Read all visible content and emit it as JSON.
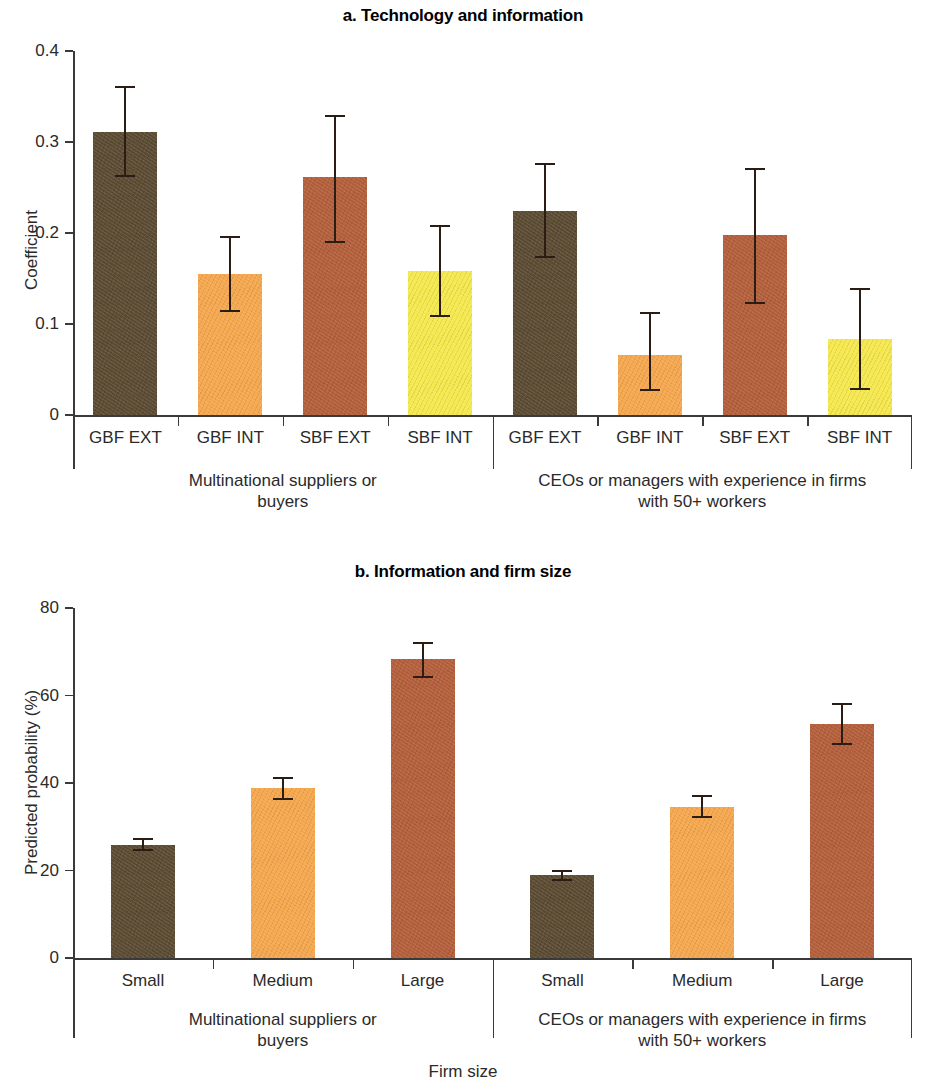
{
  "figure": {
    "panels": [
      {
        "id": "a",
        "title": "a. Technology and information",
        "ylabel": "Coefficient",
        "yticks": [
          "0",
          "0.1",
          "0.2",
          "0.3",
          "0.4"
        ]
      },
      {
        "id": "b",
        "title": "b. Information and firm size",
        "ylabel": "Predicted probability (%)",
        "yticks": [
          "0",
          "20",
          "40",
          "60",
          "80"
        ],
        "xlabel": "Firm size"
      }
    ],
    "groups": [
      "Multinational suppliers or buyers",
      "CEOs or managers with experience in firms with 50+ workers"
    ],
    "group_lines": {
      "g1_line1": "Multinational suppliers or",
      "g1_line2": "buyers",
      "g2_line1": "CEOs or managers with experience in firms",
      "g2_line2": "with 50+ workers"
    },
    "colors": {
      "dark_brown": "#5c4c33",
      "orange": "#f6a84f",
      "sienna": "#b5603c",
      "yellow": "#f6e84f",
      "axis": "#3a3a3a",
      "error": "#2b1d14",
      "text": "#2a2a2a"
    }
  },
  "chart_data": [
    {
      "type": "bar",
      "panel": "a",
      "title": "a. Technology and information",
      "xlabel": "",
      "ylabel": "Coefficient",
      "ylim": [
        0,
        0.4
      ],
      "yticks": [
        0,
        0.1,
        0.2,
        0.3,
        0.4
      ],
      "grid": false,
      "legend": "none",
      "categories": [
        "GBF EXT",
        "GBF INT",
        "SBF EXT",
        "SBF INT",
        "GBF EXT",
        "GBF INT",
        "SBF EXT",
        "SBF INT"
      ],
      "groups": [
        {
          "name": "Multinational suppliers or buyers",
          "categories": [
            "GBF EXT",
            "GBF INT",
            "SBF EXT",
            "SBF INT"
          ],
          "values": [
            0.311,
            0.155,
            0.261,
            0.158
          ],
          "err_low": [
            0.261,
            0.113,
            0.189,
            0.108
          ],
          "err_high": [
            0.361,
            0.197,
            0.33,
            0.209
          ],
          "colors": [
            "#5c4c33",
            "#f6a84f",
            "#b5603c",
            "#f6e84f"
          ]
        },
        {
          "name": "CEOs or managers with experience in firms with 50+ workers",
          "categories": [
            "GBF EXT",
            "GBF INT",
            "SBF EXT",
            "SBF INT"
          ],
          "values": [
            0.224,
            0.066,
            0.198,
            0.083
          ],
          "err_low": [
            0.172,
            0.026,
            0.122,
            0.027
          ],
          "err_high": [
            0.277,
            0.113,
            0.271,
            0.14
          ],
          "colors": [
            "#5c4c33",
            "#f6a84f",
            "#b5603c",
            "#f6e84f"
          ]
        }
      ]
    },
    {
      "type": "bar",
      "panel": "b",
      "title": "b. Information and firm size",
      "xlabel": "Firm size",
      "ylabel": "Predicted probability (%)",
      "ylim": [
        0,
        80
      ],
      "yticks": [
        0,
        20,
        40,
        60,
        80
      ],
      "grid": false,
      "legend": "none",
      "categories": [
        "Small",
        "Medium",
        "Large",
        "Small",
        "Medium",
        "Large"
      ],
      "groups": [
        {
          "name": "Multinational suppliers or buyers",
          "categories": [
            "Small",
            "Medium",
            "Large"
          ],
          "values": [
            25.9,
            38.8,
            68.4
          ],
          "err_low": [
            24.4,
            36.2,
            64.0
          ],
          "err_high": [
            27.4,
            41.3,
            72.2
          ],
          "colors": [
            "#5c4c33",
            "#f6a84f",
            "#b5603c"
          ]
        },
        {
          "name": "CEOs or managers with experience in firms with 50+ workers",
          "categories": [
            "Small",
            "Medium",
            "Large"
          ],
          "values": [
            18.9,
            34.5,
            53.6
          ],
          "err_low": [
            17.7,
            31.9,
            48.6
          ],
          "err_high": [
            20.2,
            37.3,
            58.3
          ],
          "colors": [
            "#5c4c33",
            "#f6a84f",
            "#b5603c"
          ]
        }
      ]
    }
  ]
}
